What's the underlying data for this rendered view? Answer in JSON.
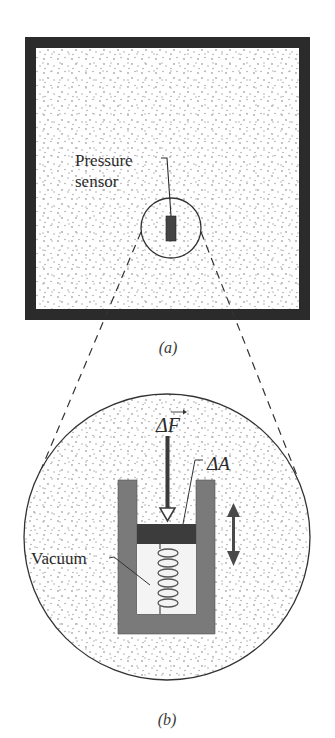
{
  "figure": {
    "panel_a": {
      "caption": "(a)",
      "sensor_label_line1": "Pressure",
      "sensor_label_line2": "sensor"
    },
    "panel_b": {
      "caption": "(b)",
      "force_label": "ΔF",
      "area_label": "ΔA",
      "vacuum_label": "Vacuum"
    }
  },
  "colors": {
    "container_wall": "#2b2b2b",
    "fluid_dots": "#a8a8a8",
    "sensor": "#444444",
    "cylinder": "#7a7a7a",
    "piston": "#3c3c3c",
    "vacuum": "#f4f4f4",
    "outline": "#333333"
  }
}
